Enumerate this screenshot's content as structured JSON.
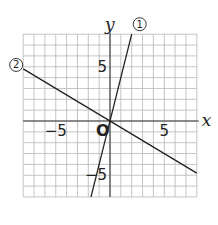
{
  "chart_data": {
    "type": "line",
    "title": "",
    "xlabel": "x",
    "ylabel": "y",
    "xlim": [
      -8,
      8
    ],
    "ylim": [
      -7,
      8
    ],
    "grid": true,
    "origin_label": "O",
    "x_tick_labels": [
      {
        "value": -5,
        "label": "−5"
      },
      {
        "value": 5,
        "label": "5"
      }
    ],
    "y_tick_labels": [
      {
        "value": 5,
        "label": "5"
      },
      {
        "value": -5,
        "label": "−5"
      }
    ],
    "series": [
      {
        "name": "①",
        "label": "1",
        "equation": "y = 4x",
        "slope": 4,
        "intercept": 0,
        "x": [
          -1.75,
          2
        ],
        "y": [
          -7,
          8
        ]
      },
      {
        "name": "②",
        "label": "2",
        "equation": "y = -0.6x",
        "slope": -0.6,
        "intercept": 0,
        "x": [
          -8,
          8
        ],
        "y": [
          4.8,
          -4.8
        ]
      }
    ]
  }
}
